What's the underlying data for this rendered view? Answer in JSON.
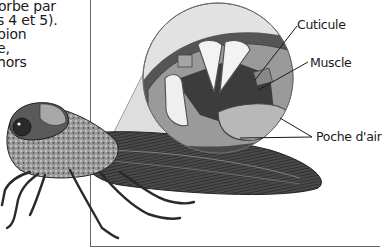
{
  "body_text": {
    "lines": [
      "orbe par",
      "s 4 et 5).",
      "pion",
      "e,",
      " hors"
    ]
  },
  "figure": {
    "labels": {
      "cuticle": "Cuticule",
      "muscle": "Muscle",
      "air_pocket": "Poche d'air"
    },
    "colors": {
      "frame": "#666666",
      "dark_tone": "#3a3a3a",
      "mid_tone": "#8a8a8a",
      "light_tone": "#d4d4d4"
    }
  }
}
